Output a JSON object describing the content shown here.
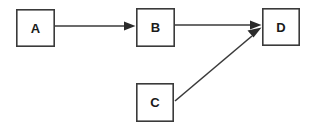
{
  "diagram": {
    "type": "flowchart",
    "background_color": "#ffffff",
    "stroke_color": "#3a3a3a",
    "label_color": "#1a1a1a",
    "arrowhead_color": "#2b2b2b",
    "nodes": [
      {
        "id": "A",
        "label": "A",
        "shape": "rectangle",
        "x": 16,
        "y": 9,
        "width": 39,
        "height": 38,
        "cx": 35.5,
        "cy": 28
      },
      {
        "id": "B",
        "label": "B",
        "shape": "rectangle",
        "x": 136,
        "y": 8,
        "width": 39,
        "height": 39,
        "cx": 155.5,
        "cy": 27.5
      },
      {
        "id": "C",
        "label": "C",
        "shape": "rectangle",
        "x": 136,
        "y": 83,
        "width": 38,
        "height": 39,
        "cx": 155,
        "cy": 102.5
      },
      {
        "id": "D",
        "label": "D",
        "shape": "rectangle",
        "x": 262,
        "y": 8,
        "width": 38,
        "height": 38,
        "cx": 281,
        "cy": 27
      }
    ],
    "edges": [
      {
        "id": "A-B",
        "from": "A",
        "to": "B",
        "label": "",
        "directed": true,
        "style": "straight",
        "x1": 55,
        "y1": 26,
        "x2": 136,
        "y2": 26
      },
      {
        "id": "B-D",
        "from": "B",
        "to": "D",
        "label": "",
        "directed": true,
        "style": "straight",
        "x1": 175,
        "y1": 25,
        "x2": 262,
        "y2": 25
      },
      {
        "id": "C-D",
        "from": "C",
        "to": "D",
        "label": "",
        "directed": true,
        "style": "straight",
        "x1": 175,
        "y1": 101,
        "x2": 261,
        "y2": 28
      }
    ]
  }
}
